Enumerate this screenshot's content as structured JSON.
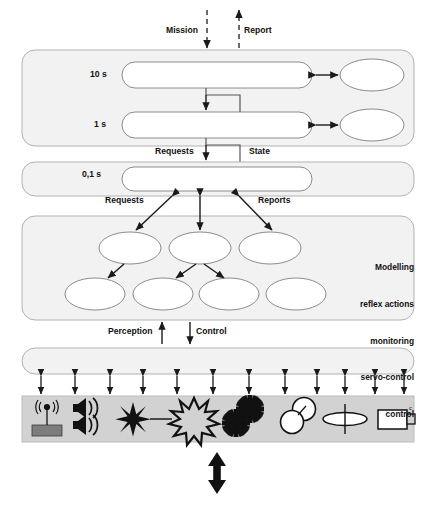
{
  "diagram": {
    "colors": {
      "band_fill": "#f2f2f2",
      "band_stroke": "#b0b0b0",
      "node_fill": "#ffffff",
      "node_stroke": "#8c8c8c",
      "sensor_bar_fill": "#d0d0d0",
      "sensor_bar_stroke": "#b8b8b8",
      "arrow": "#1a1a1a",
      "text": "#111111",
      "icon_dark": "#111111",
      "icon_gray": "#808080"
    },
    "top_labels": [
      {
        "name": "mission-label",
        "text": "Mission",
        "x": 166,
        "y": 30
      },
      {
        "name": "report-label",
        "text": "Report",
        "x": 241,
        "y": 30
      }
    ],
    "layers": [
      {
        "name": "layer-band-deliberative",
        "period_labels": [
          "10 s",
          "1 s"
        ],
        "rows": [
          {
            "period": "10 s",
            "capsule": "capsule-10s",
            "ellipse": "ellipse-10s"
          },
          {
            "period": "1 s",
            "capsule": "capsule-1s",
            "ellipse": "ellipse-1s"
          }
        ]
      },
      {
        "name": "layer-band-sequencing",
        "period_labels": [
          "0,1 s"
        ],
        "rows": [
          {
            "period": "0,1 s",
            "capsule": "capsule-01s"
          }
        ]
      },
      {
        "name": "layer-band-reactive",
        "ellipse_rows": [
          {
            "count": 3,
            "names": [
              "ellipse-r1-c1",
              "ellipse-r1-c2",
              "ellipse-r1-c3"
            ]
          },
          {
            "count": 4,
            "names": [
              "ellipse-r2-c1",
              "ellipse-r2-c2",
              "ellipse-r2-c3",
              "ellipse-r2-c4"
            ]
          }
        ],
        "side_text_lines": [
          "Modelling",
          "reflex actions",
          "monitoring",
          "servo-control",
          "control"
        ]
      },
      {
        "name": "layer-band-hardware-interface",
        "period_labels": [],
        "rows": []
      }
    ],
    "connector_labels": [
      {
        "name": "requests-label-upper",
        "text": "Requests",
        "x": 158,
        "y": 152
      },
      {
        "name": "state-label-upper",
        "text": "State",
        "x": 248,
        "y": 152
      },
      {
        "name": "requests-label-lower",
        "text": "Requests",
        "x": 105,
        "y": 199
      },
      {
        "name": "reports-label-lower",
        "text": "Reports",
        "x": 256,
        "y": 199
      },
      {
        "name": "perception-label",
        "text": "Perception",
        "x": 108,
        "y": 330
      },
      {
        "name": "control-label",
        "text": "Control",
        "x": 197,
        "y": 330
      }
    ],
    "sensor_bar": {
      "name": "sensor-actuator-bar",
      "icon_count": 8,
      "icons": [
        {
          "name": "antenna-transmitter-icon",
          "label": "antenna-transmitter"
        },
        {
          "name": "loudspeaker-pair-icon",
          "label": "loudspeakers"
        },
        {
          "name": "laser-beam-icon",
          "label": "laser-beam"
        },
        {
          "name": "starburst-icon",
          "label": "starburst-flash"
        },
        {
          "name": "gear-pair-icon",
          "label": "gears"
        },
        {
          "name": "overlapping-circles-icon",
          "label": "overlapping-circles"
        },
        {
          "name": "antenna-dish-icon",
          "label": "dish-antenna"
        },
        {
          "name": "camera-icon",
          "label": "camera"
        }
      ],
      "coupling_arrow_count": 12
    },
    "bottom_arrow": {
      "name": "environment-interaction-arrow",
      "direction": "bidirectional-vertical"
    }
  }
}
